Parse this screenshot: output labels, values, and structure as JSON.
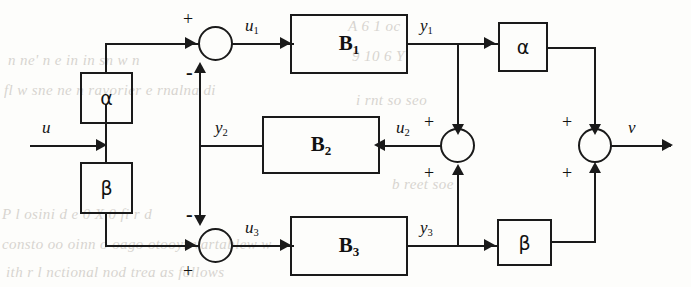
{
  "figure": {
    "kind": "control-system-block-diagram"
  },
  "blocks": {
    "gain_alpha_in": {
      "label": "α",
      "name": "alpha"
    },
    "gain_beta_in": {
      "label": "β",
      "name": "beta"
    },
    "plant_b1": {
      "label": "B",
      "sub": "1"
    },
    "plant_b2": {
      "label": "B",
      "sub": "2"
    },
    "plant_b3": {
      "label": "B",
      "sub": "3"
    },
    "gain_alpha_out": {
      "label": "α",
      "name": "alpha"
    },
    "gain_beta_out": {
      "label": "β",
      "name": "beta"
    }
  },
  "signals": {
    "input": {
      "label": "u"
    },
    "u1": {
      "label": "u",
      "sub": "1"
    },
    "u2": {
      "label": "u",
      "sub": "2"
    },
    "u3": {
      "label": "u",
      "sub": "3"
    },
    "y1": {
      "label": "y",
      "sub": "1"
    },
    "y2": {
      "label": "y",
      "sub": "2"
    },
    "y3": {
      "label": "y",
      "sub": "3"
    },
    "output": {
      "label": "v"
    }
  },
  "summing_junctions": {
    "sum_top": {
      "plus": "+",
      "minus": "-"
    },
    "sum_bottom": {
      "minus": "-",
      "plus": "+"
    },
    "sum_mid": {
      "plus_top": "+",
      "plus_bottom": "+"
    },
    "sum_out": {
      "plus_top": "+",
      "plus_bottom": "+"
    }
  },
  "background_text": {
    "line1": "n  ne'  n  e    in  in  sn  w  n",
    "line2": "fl    w  sne  ne n  ravorier  e  rnalna   di",
    "line3": "r  s  r  d    r  A  0     X  0    fi   r  d",
    "line4": "consto  oo  oinn    o  oago  otooyr  vartablew  w",
    "line5": "ith  r  l  nctional  nod  trea  as  follows",
    "line6": "A   6    1  oc",
    "line7": "9 10     6    Y",
    "line8": "i  rnt  so  seo",
    "line9": "b  reet  soe",
    "line10": "P  l  osini  d  e  0    X  0    fi   r  d"
  },
  "colors": {
    "ink": "#1a1a1a",
    "paper": "#fdfdfb",
    "ghost": "#b9b4ad"
  }
}
